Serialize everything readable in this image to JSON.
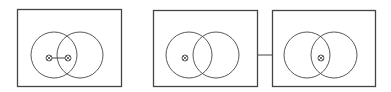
{
  "diagram": {
    "colors": {
      "stroke": "#444444",
      "background": "#ffffff"
    },
    "panels": [
      {
        "id": "panel-1",
        "frame": {
          "x": 17,
          "y": 9,
          "w": 104,
          "h": 77
        },
        "circles": [
          {
            "cx": 54,
            "cy": 55,
            "r": 23
          },
          {
            "cx": 80,
            "cy": 55,
            "r": 23
          }
        ],
        "markers": [
          {
            "cx": 49,
            "cy": 58,
            "symbol": "circled-cross"
          },
          {
            "cx": 68,
            "cy": 58,
            "symbol": "circled-cross"
          }
        ],
        "marker_link": true
      },
      {
        "id": "panel-2",
        "frame": {
          "x": 153,
          "y": 10,
          "w": 104,
          "h": 76
        },
        "circles": [
          {
            "cx": 189,
            "cy": 55,
            "r": 23
          },
          {
            "cx": 216,
            "cy": 55,
            "r": 23
          }
        ],
        "markers": [
          {
            "cx": 185,
            "cy": 58,
            "symbol": "circled-cross"
          }
        ],
        "marker_link": false
      },
      {
        "id": "panel-3",
        "frame": {
          "x": 272,
          "y": 10,
          "w": 103,
          "h": 76
        },
        "circles": [
          {
            "cx": 307,
            "cy": 55,
            "r": 23
          },
          {
            "cx": 334,
            "cy": 55,
            "r": 23
          }
        ],
        "markers": [
          {
            "cx": 321,
            "cy": 58,
            "symbol": "circled-cross"
          }
        ],
        "marker_link": false
      }
    ],
    "connector": {
      "from": "panel-2",
      "to": "panel-3",
      "x1": 257,
      "x2": 272,
      "y": 55
    }
  }
}
